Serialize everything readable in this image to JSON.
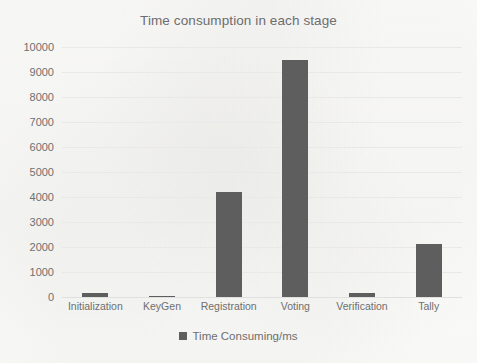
{
  "chart_data": {
    "type": "bar",
    "title": "Time consumption in each stage",
    "xlabel": "",
    "ylabel": "",
    "categories": [
      "Initialization",
      "KeyGen",
      "Registration",
      "Voting",
      "Verification",
      "Tally"
    ],
    "series": [
      {
        "name": "Time Consuming/ms",
        "values": [
          150,
          60,
          4200,
          9500,
          160,
          2120
        ]
      }
    ],
    "ylim": [
      0,
      10000
    ],
    "ytick_labels": [
      "10000",
      "9000",
      "8000",
      "7000",
      "6000",
      "5000",
      "4000",
      "3000",
      "2000",
      "1000",
      "0"
    ],
    "ytick_values": [
      10000,
      9000,
      8000,
      7000,
      6000,
      5000,
      4000,
      3000,
      2000,
      1000,
      0
    ],
    "grid": true,
    "legend": {
      "position": "bottom",
      "entries": [
        "Time Consuming/ms"
      ]
    },
    "bar_color": "#5e5e5e",
    "grid_color": "#e9e9e7",
    "text_color": "#6f6f6f",
    "background_color": "#fbfbfa"
  }
}
